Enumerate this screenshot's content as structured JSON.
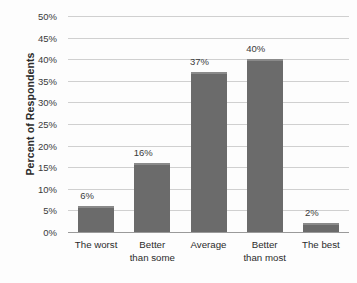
{
  "chart_data": {
    "type": "bar",
    "title": "",
    "subtitle": "",
    "xlabel": "",
    "ylabel": "Percent of Respondents",
    "categories": [
      "The worst",
      "Better than some",
      "Average",
      "Better than most",
      "The best"
    ],
    "category_lines": [
      [
        "The worst",
        ""
      ],
      [
        "Better",
        "than some"
      ],
      [
        "Average",
        ""
      ],
      [
        "Better",
        "than most"
      ],
      [
        "The best",
        ""
      ]
    ],
    "values": [
      6,
      16,
      37,
      40,
      2
    ],
    "value_labels": [
      "6%",
      "16%",
      "37%",
      "40%",
      "2%"
    ],
    "ylim": [
      0,
      50
    ],
    "ytick_step": 5,
    "ytick_labels": [
      "50%",
      "45%",
      "40%",
      "35%",
      "30%",
      "25%",
      "20%",
      "15%",
      "10%",
      "5%",
      "0%"
    ],
    "ytick_values": [
      50,
      45,
      40,
      35,
      30,
      25,
      20,
      15,
      10,
      5,
      0
    ],
    "grid": true,
    "grid_orientation": "horizontal",
    "legend": false,
    "legend_position": "none",
    "bar_color": "#6b6b6b",
    "bar_top_highlight_color": "#8a8a8a",
    "gridline_color": "#d0d0d0",
    "axis_line_color": "#9a9a9a",
    "background_color": "#fdfdfd",
    "text_color": "#2b2b2b"
  }
}
